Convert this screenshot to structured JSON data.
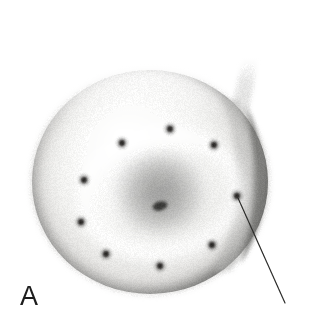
{
  "figure": {
    "panel_label": "A",
    "modality": "grayscale-electron-micrograph",
    "background_color": "#ffffff",
    "width": 309,
    "height": 328,
    "specimen": {
      "name": "disc-shaped-cell",
      "center_x": 150,
      "center_y": 182,
      "radius_x": 118,
      "radius_y": 112,
      "body_fill": "#f2f2f1",
      "rim_shadow_color": "#6e6e6c",
      "central_depression": {
        "center_x": 160,
        "center_y": 193,
        "radius_x": 54,
        "radius_y": 40,
        "shade_color": "#8a8a88",
        "core_dot_x": 160,
        "core_dot_y": 206,
        "core_dot_color": "#3a3a38"
      },
      "membrane_fold": {
        "name": "right-edge-crescent",
        "color": "#7a7a78"
      },
      "tail": {
        "name": "wispy-tail",
        "tip_x": 253,
        "tip_y": 22,
        "base_x": 238,
        "base_y": 128,
        "color": "#c9c9c7"
      }
    },
    "marker_dots": {
      "count": 10,
      "color": "#2c2a28",
      "radius": 3.4,
      "points": [
        {
          "id": "dot-1",
          "x": 170,
          "y": 129
        },
        {
          "id": "dot-2",
          "x": 214,
          "y": 145
        },
        {
          "id": "dot-3",
          "x": 237,
          "y": 196
        },
        {
          "id": "dot-4",
          "x": 212,
          "y": 245
        },
        {
          "id": "dot-5",
          "x": 160,
          "y": 266
        },
        {
          "id": "dot-6",
          "x": 106,
          "y": 254
        },
        {
          "id": "dot-7",
          "x": 81,
          "y": 222
        },
        {
          "id": "dot-8",
          "x": 84,
          "y": 180
        },
        {
          "id": "dot-9",
          "x": 122,
          "y": 143
        },
        {
          "id": "dot-10",
          "x": 160,
          "y": 206
        }
      ]
    },
    "leader_line": {
      "name": "pointer-line",
      "start_x": 238,
      "start_y": 198,
      "end_x": 285,
      "end_y": 303,
      "color": "#2e2e2c",
      "width": 1.2,
      "target_dot_id": "dot-3"
    }
  }
}
